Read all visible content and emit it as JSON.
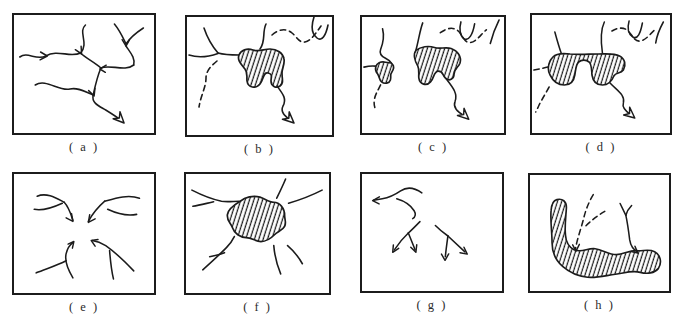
{
  "figure": {
    "panels": [
      {
        "id": "a",
        "label": "( a )",
        "alt": "dendritic stream network converging to an outlet arrow"
      },
      {
        "id": "b",
        "label": "( b )",
        "alt": "stream network with one hatched lake and dashed abandoned channels"
      },
      {
        "id": "c",
        "label": "( c )",
        "alt": "stream network with two hatched lakes and dashed channels"
      },
      {
        "id": "d",
        "label": "( d )",
        "alt": "merged double-lobed hatched lake with outlet stream"
      },
      {
        "id": "e",
        "label": "( e )",
        "alt": "four stream groups converging toward the centre"
      },
      {
        "id": "f",
        "label": "( f )",
        "alt": "central hatched lake fed by radial streams"
      },
      {
        "id": "g",
        "label": "( g )",
        "alt": "streams diverging outward with arrows"
      },
      {
        "id": "h",
        "label": "( h )",
        "alt": "large elongated hatched lake with dashed and solid inflows"
      }
    ]
  },
  "colors": {
    "ink": "#1b1b1b",
    "paper": "#ffffff",
    "frame": "#1c1c1c"
  }
}
